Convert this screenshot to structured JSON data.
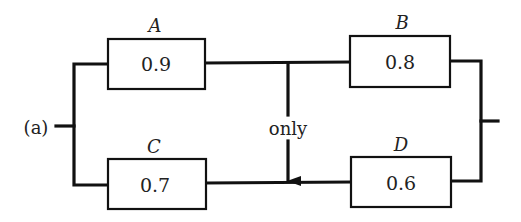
{
  "diagram": {
    "type": "reliability-block-diagram",
    "input_label": "(a)",
    "connector_label": "only",
    "connector_direction": "down",
    "components": [
      {
        "id": "A",
        "label": "A",
        "reliability": "0.9",
        "position": "top-left"
      },
      {
        "id": "B",
        "label": "B",
        "reliability": "0.8",
        "position": "top-right"
      },
      {
        "id": "C",
        "label": "C",
        "reliability": "0.7",
        "position": "bottom-left"
      },
      {
        "id": "D",
        "label": "D",
        "reliability": "0.6",
        "position": "bottom-right"
      }
    ],
    "connections": [
      "input -> A",
      "input -> C",
      "A -> B",
      "C -> D",
      "A-B junction -> C-D junction (one-way, labeled 'only')",
      "B -> output",
      "D -> output"
    ],
    "colors": {
      "line": "#111111",
      "background": "#ffffff",
      "text": "#222222"
    }
  }
}
